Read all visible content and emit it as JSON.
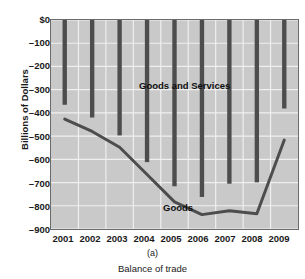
{
  "chart_data": {
    "type": "bar",
    "title": "",
    "panel_letter": "(a)",
    "caption": "Balance of trade",
    "xlabel": "",
    "ylabel": "Billions of Dollars",
    "categories": [
      "2001",
      "2002",
      "2003",
      "2004",
      "2005",
      "2006",
      "2007",
      "2008",
      "2009"
    ],
    "ylim": [
      -900,
      0
    ],
    "ytick_labels": [
      "$0",
      "–100",
      "–200",
      "–300",
      "–400",
      "–500",
      "–600",
      "–700",
      "–800",
      "–900"
    ],
    "ytick_values": [
      0,
      -100,
      -200,
      -300,
      -400,
      -500,
      -600,
      -700,
      -800,
      -900
    ],
    "grid": true,
    "legend_position": "inside-annotations",
    "series": [
      {
        "name": "Goods and Services",
        "render": "bar",
        "color": "#4d4d4d",
        "baseline": 0,
        "values": [
          -365,
          -420,
          -497,
          -612,
          -716,
          -762,
          -705,
          -699,
          -381
        ]
      },
      {
        "name": "Goods",
        "render": "line",
        "color": "#4d4d4d",
        "values": [
          -427,
          -480,
          -548,
          -665,
          -783,
          -838,
          -821,
          -834,
          -517
        ]
      }
    ],
    "annotations": [
      {
        "text": "Goods and Services",
        "x": "2003",
        "y": -250
      },
      {
        "text": "Goods",
        "x": "2004",
        "y": -720
      }
    ],
    "colors": {
      "plot_background": "#c9c9c9",
      "gridline": "#efefef",
      "axis_border": "#6b6b6b",
      "bar": "#4d4d4d",
      "line": "#4d4d4d",
      "text": "#1a1a1a"
    }
  }
}
